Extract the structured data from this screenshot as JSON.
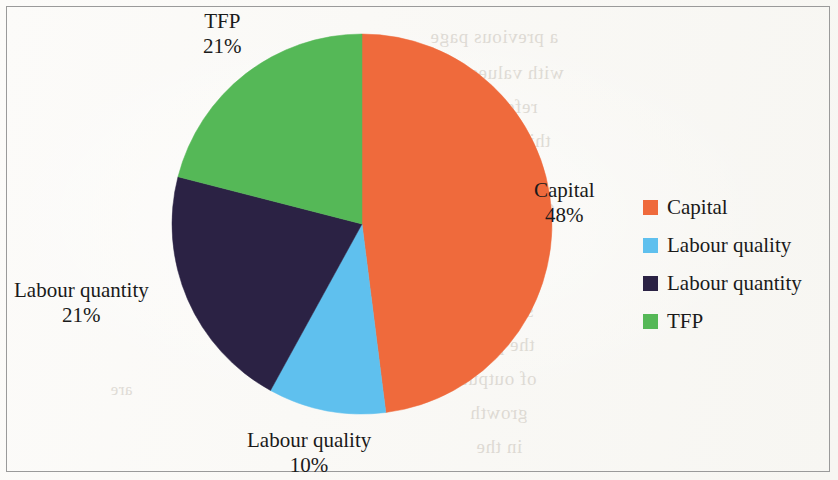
{
  "figure": {
    "background_color": "#fbfaf7",
    "border_color": "#9a9a9a",
    "text_color": "#1a1a1a"
  },
  "chart_data": {
    "type": "pie",
    "title": "",
    "subtitle": "",
    "xlabel": "",
    "ylabel": "",
    "categories": [
      "Capital",
      "Labour quality",
      "Labour quantity",
      "TFP"
    ],
    "values": [
      48,
      10,
      21,
      21
    ],
    "unit": "%",
    "start_angle_deg": 0,
    "direction": "clockwise",
    "colors": [
      "#ef6a3c",
      "#5fc0ee",
      "#2b2244",
      "#55b857"
    ],
    "slices": [
      {
        "name": "Capital",
        "value": 48,
        "label": "Capital",
        "percent_label": "48%",
        "color": "#ef6a3c",
        "start_deg": 0,
        "end_deg": 172.8,
        "label_x": 534,
        "label_y": 178
      },
      {
        "name": "Labour quality",
        "value": 10,
        "label": "Labour quality",
        "percent_label": "10%",
        "color": "#5fc0ee",
        "start_deg": 172.8,
        "end_deg": 208.8,
        "label_x": 247,
        "label_y": 428
      },
      {
        "name": "Labour quantity",
        "value": 21,
        "label": "Labour quantity",
        "percent_label": "21%",
        "color": "#2b2244",
        "start_deg": 208.8,
        "end_deg": 284.4,
        "label_x": 14,
        "label_y": 278
      },
      {
        "name": "TFP",
        "value": 21,
        "label": "TFP",
        "percent_label": "21%",
        "color": "#55b857",
        "start_deg": 284.4,
        "end_deg": 360,
        "label_x": 203,
        "label_y": 9
      }
    ],
    "legend": {
      "position": "right",
      "entries": [
        {
          "label": "Capital",
          "color": "#ef6a3c"
        },
        {
          "label": "Labour quality",
          "color": "#5fc0ee"
        },
        {
          "label": "Labour quantity",
          "color": "#2b2244"
        },
        {
          "label": "TFP",
          "color": "#55b857"
        }
      ]
    },
    "geometry": {
      "cx": 362,
      "cy": 224,
      "r": 190
    },
    "grid": false
  },
  "bleed_text": [
    {
      "text": "a previous page",
      "x": 430,
      "y": 26,
      "size": 19
    },
    {
      "text": "with values",
      "x": 470,
      "y": 62,
      "size": 19
    },
    {
      "text": "reference to",
      "x": 440,
      "y": 96,
      "size": 19
    },
    {
      "text": "this chart of",
      "x": 452,
      "y": 130,
      "size": 19
    },
    {
      "text": "the data",
      "x": 460,
      "y": 164,
      "size": 19
    },
    {
      "text": "colour of",
      "x": 480,
      "y": 196,
      "size": 19
    },
    {
      "text": "the growth",
      "x": 452,
      "y": 232,
      "size": 19
    },
    {
      "text": "over the",
      "x": 470,
      "y": 266,
      "size": 19
    },
    {
      "text": "share of",
      "x": 468,
      "y": 300,
      "size": 19
    },
    {
      "text": "the period",
      "x": 452,
      "y": 334,
      "size": 19
    },
    {
      "text": "of output",
      "x": 462,
      "y": 368,
      "size": 19
    },
    {
      "text": "growth",
      "x": 470,
      "y": 402,
      "size": 19
    },
    {
      "text": "in the",
      "x": 476,
      "y": 436,
      "size": 19
    },
    {
      "text": "figures",
      "x": 210,
      "y": 300,
      "size": 17
    },
    {
      "text": "source",
      "x": 220,
      "y": 200,
      "size": 17
    },
    {
      "text": "are",
      "x": 110,
      "y": 380,
      "size": 17
    }
  ]
}
